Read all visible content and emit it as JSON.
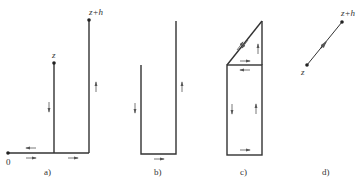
{
  "figure": {
    "panels": [
      {
        "id": "a",
        "caption": "a)",
        "labels": {
          "origin": "0",
          "lower": "z",
          "upper": "z+h"
        }
      },
      {
        "id": "b",
        "caption": "b)"
      },
      {
        "id": "c",
        "caption": "c)"
      },
      {
        "id": "d",
        "caption": "d)",
        "labels": {
          "lower": "z",
          "upper": "z+h"
        }
      }
    ],
    "colors": {
      "line": "#333333",
      "arrow": "#555555"
    }
  }
}
